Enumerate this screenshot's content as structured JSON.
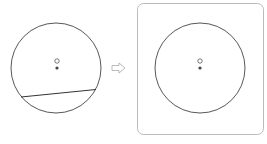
{
  "diagram": {
    "left_figure": {
      "circle": {
        "cx": 56,
        "cy": 68,
        "r": 45
      },
      "chord": {
        "x1": 21,
        "y1": 97,
        "x2": 96,
        "y2": 89
      },
      "hollow_point": {
        "cx": 57,
        "cy": 61,
        "r": 2.2
      },
      "solid_point": {
        "cx": 57,
        "cy": 68,
        "r": 1.6
      }
    },
    "arrow": {
      "direction": "right",
      "x": 112,
      "y": 68
    },
    "right_figure": {
      "frame": {
        "x": 137,
        "y": 3,
        "width": 126,
        "height": 131,
        "rx": 6
      },
      "circle": {
        "cx": 200,
        "cy": 68,
        "r": 45
      },
      "hollow_point": {
        "cx": 200,
        "cy": 61,
        "r": 2.2
      },
      "solid_point": {
        "cx": 200,
        "cy": 68,
        "r": 1.6
      }
    },
    "colors": {
      "stroke": "#444444",
      "frame": "#bbbbbb",
      "arrow": "#aaaaaa"
    }
  }
}
